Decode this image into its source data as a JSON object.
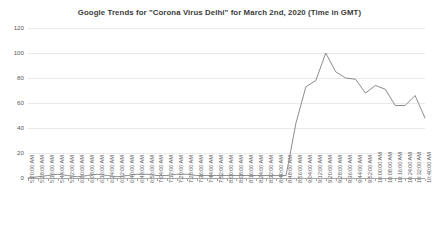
{
  "chart_data": {
    "type": "line",
    "title": "Google Trends for \"Corona Virus Delhi\" for March 2nd, 2020 (Time in GMT)",
    "xlabel": "",
    "ylabel": "",
    "ylim": [
      0,
      120
    ],
    "yticks": [
      0,
      20,
      40,
      60,
      80,
      100,
      120
    ],
    "grid": true,
    "legend": false,
    "line_color": "#808080",
    "categories": [
      "5:20:00 AM",
      "5:28:00 AM",
      "5:36:00 AM",
      "5:44:00 AM",
      "5:52:00 AM",
      "6:00:00 AM",
      "6:08:00 AM",
      "6:16:00 AM",
      "6:24:00 AM",
      "6:32:00 AM",
      "6:40:00 AM",
      "6:48:00 AM",
      "6:56:00 AM",
      "7:04:00 AM",
      "7:12:00 AM",
      "7:20:00 AM",
      "7:28:00 AM",
      "7:36:00 AM",
      "7:44:00 AM",
      "7:52:00 AM",
      "8:00:00 AM",
      "8:08:00 AM",
      "8:16:00 AM",
      "8:24:00 AM",
      "8:32:00 AM",
      "8:40:00 AM",
      "8:48:00 AM",
      "8:56:00 AM",
      "9:04:00 AM",
      "9:12:00 AM",
      "9:20:00 AM",
      "9:28:00 AM",
      "9:36:00 AM",
      "9:44:00 AM",
      "9:52:00 AM",
      "10:00:00 AM",
      "10:08:00 AM",
      "10:16:00 AM",
      "10:24:00 AM",
      "10:32:00 AM",
      "10:40:00 AM"
    ],
    "values": [
      0,
      1,
      2,
      3,
      2,
      1,
      2,
      3,
      2,
      1,
      2,
      3,
      3,
      2,
      2,
      3,
      3,
      2,
      2,
      2,
      2,
      2,
      2,
      2,
      2,
      2,
      2,
      44,
      73,
      78,
      100,
      85,
      80,
      79,
      68,
      74,
      71,
      58,
      58,
      66,
      48
    ]
  }
}
